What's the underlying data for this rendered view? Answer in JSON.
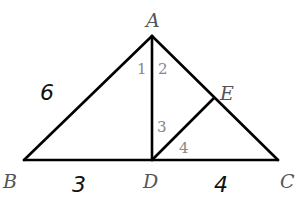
{
  "diagram": {
    "type": "geometry-triangle",
    "points": {
      "A": {
        "label": "A",
        "x": 152,
        "y": 36
      },
      "B": {
        "label": "B",
        "x": 24,
        "y": 160
      },
      "C": {
        "label": "C",
        "x": 278,
        "y": 160
      },
      "D": {
        "label": "D",
        "x": 152,
        "y": 160
      },
      "E": {
        "label": "E",
        "x": 214,
        "y": 98
      }
    },
    "segments": [
      "AB",
      "AC",
      "BC",
      "AD",
      "DE"
    ],
    "angles": {
      "a1": "1",
      "a2": "2",
      "a3": "3",
      "a4": "4"
    },
    "handwritten": {
      "AB_length": "6",
      "BD_length": "3",
      "DC_length": "4"
    },
    "line_color": "#000000",
    "label_color": "#555555"
  }
}
